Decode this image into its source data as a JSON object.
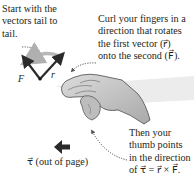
{
  "labels": {
    "start": [
      "Start with the",
      "vectors tail to",
      "tail."
    ],
    "curl": [
      "Curl your fingers in a",
      "direction that rotates",
      "the first vector (r⃗)",
      "onto the second (F⃗)."
    ],
    "thumb": [
      "Then your",
      "thumb points",
      "in the direction",
      "of τ⃗ = r⃗ × F⃗."
    ],
    "torque_dir": "τ⃗ (out of page)"
  },
  "vectors": {
    "F": "F⃗",
    "r": "r⃗"
  },
  "colors": {
    "text": "#231f20",
    "vector": "#2b2b2b",
    "rotation_arrow": "#b8b8b8",
    "hand_fill": "#c9c9c9",
    "hand_stroke": "#4a4a4a",
    "page_surface": "#e9e9e9"
  }
}
